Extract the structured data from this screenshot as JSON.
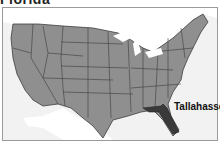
{
  "title": "Florida",
  "map": {
    "highlighted_state": "Florida",
    "capital_label": "Tallahassee",
    "colors": {
      "states": "#8f8f8f",
      "highlight": "#3a3a3a",
      "water": "#f2f2f2",
      "border": "#3d3d3d",
      "neighbors": "#ffffff"
    }
  }
}
